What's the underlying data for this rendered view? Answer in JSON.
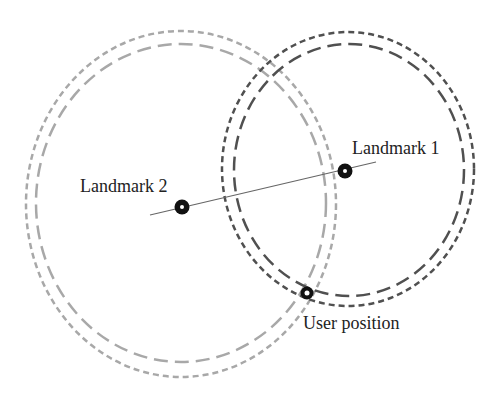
{
  "diagram": {
    "landmarks": [
      {
        "id": "landmark-1",
        "label": "Landmark 1",
        "x": 345,
        "y": 171
      },
      {
        "id": "landmark-2",
        "label": "Landmark 2",
        "x": 182,
        "y": 207
      }
    ],
    "user": {
      "label": "User position",
      "x": 307,
      "y": 293
    },
    "colors": {
      "light_circles": "#a8a8a8",
      "dark_circles": "#505050",
      "line": "#666666",
      "marker": "#111111"
    }
  }
}
